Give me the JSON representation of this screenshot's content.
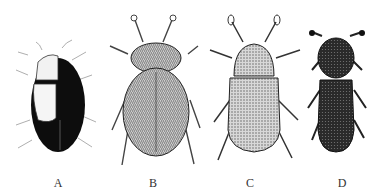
{
  "figure": {
    "panels": [
      {
        "label": "A",
        "subject": "beetle-a",
        "style": "dark oval body with pale left elytral patch"
      },
      {
        "label": "B",
        "subject": "beetle-b",
        "style": "hairy stippled oval beetle"
      },
      {
        "label": "C",
        "subject": "beetle-c",
        "style": "stippled oval beetle with clubbed antennae"
      },
      {
        "label": "D",
        "subject": "beetle-d",
        "style": "dark elongate beetle with rounded pronotum"
      }
    ]
  },
  "colors": {
    "background": "#ffffff",
    "ink": "#111111",
    "stipple": "#777777"
  }
}
